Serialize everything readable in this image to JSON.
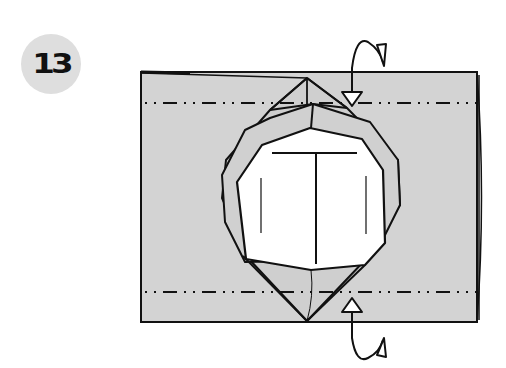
{
  "step": {
    "number": "13"
  },
  "diagram": {
    "paper_color": "#d3d3d3",
    "line_color": "#111111",
    "inner_color": "#ffffff",
    "badge_color": "#dedede",
    "folds": [
      {
        "type": "mountain-fold",
        "position": "top",
        "y": 103
      },
      {
        "type": "mountain-fold",
        "position": "bottom",
        "y": 292
      }
    ],
    "arrows": [
      {
        "type": "fold-behind-arrow",
        "position": "top",
        "direction": "down"
      },
      {
        "type": "fold-behind-arrow",
        "position": "bottom",
        "direction": "up"
      }
    ]
  }
}
